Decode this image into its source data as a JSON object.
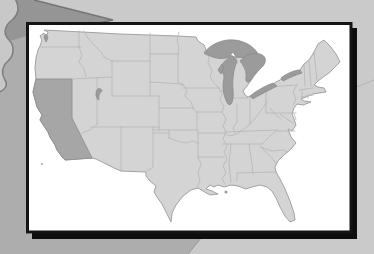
{
  "slide": {
    "type": "map-card-slide",
    "content": "Map of the contiguous United States on a white card with drop shadow over an abstract gray background",
    "highlighted_state": "California"
  },
  "map": {
    "region": "Contiguous United States",
    "highlighted_state": "California",
    "water_features": [
      "Lake Superior",
      "Lake Michigan",
      "Lake Huron",
      "Lake Erie",
      "Lake Ontario",
      "Great Salt Lake"
    ]
  },
  "colors": {
    "background": "#cacaca",
    "background_left_band": "#adadad",
    "background_wedge": "#959595",
    "background_blob": "#c8c8c8",
    "card_background": "#ffffff",
    "card_border": "#141414",
    "card_shadow": "#0d0d0d",
    "state_fill": "#d4d4d4",
    "state_border": "#b6b6b6",
    "california_fill": "#a6a6a6",
    "lake_fill": "#9b9b9b"
  }
}
